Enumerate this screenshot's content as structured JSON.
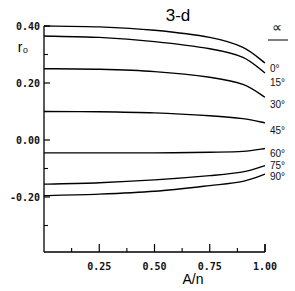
{
  "chart_data": {
    "type": "line",
    "title": "3-d",
    "xlabel": "A/n",
    "ylabel": "r₀",
    "xlim": [
      0,
      1.0
    ],
    "ylim": [
      -0.4,
      0.4
    ],
    "grid": false,
    "x_ticks": [
      0.25,
      0.5,
      0.75,
      1.0
    ],
    "x_tick_labels": [
      "0.25",
      "0.50",
      "0.75",
      "1.00"
    ],
    "y_ticks": [
      0.4,
      0.2,
      0.0,
      -0.2
    ],
    "y_tick_labels": [
      "0.40",
      "0.20",
      "0.00",
      "-0.20"
    ],
    "legend_title": "∝",
    "legend_position": "right, at line ends",
    "x": [
      0,
      0.25,
      0.5,
      0.75,
      0.9,
      1.0
    ],
    "series": [
      {
        "name": "0°",
        "values": [
          0.4,
          0.397,
          0.385,
          0.36,
          0.325,
          0.27
        ]
      },
      {
        "name": "15°",
        "values": [
          0.365,
          0.36,
          0.345,
          0.32,
          0.29,
          0.235
        ]
      },
      {
        "name": "30°",
        "values": [
          0.25,
          0.248,
          0.24,
          0.22,
          0.195,
          0.15
        ]
      },
      {
        "name": "45°",
        "values": [
          0.1,
          0.099,
          0.095,
          0.085,
          0.075,
          0.06
        ]
      },
      {
        "name": "60°",
        "values": [
          -0.045,
          -0.045,
          -0.045,
          -0.043,
          -0.04,
          -0.03
        ]
      },
      {
        "name": "75°",
        "values": [
          -0.155,
          -0.15,
          -0.14,
          -0.125,
          -0.112,
          -0.09
        ]
      },
      {
        "name": "90°",
        "values": [
          -0.195,
          -0.19,
          -0.18,
          -0.16,
          -0.145,
          -0.12
        ]
      }
    ]
  }
}
